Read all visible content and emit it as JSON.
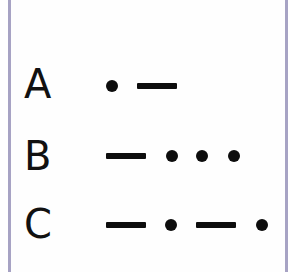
{
  "colors": {
    "border": "#a7a3c4",
    "ink": "#0d0d0d"
  },
  "rows": [
    {
      "letter": "A",
      "code": ".-",
      "symbols": [
        "dot",
        "dash"
      ]
    },
    {
      "letter": "B",
      "code": "-...",
      "symbols": [
        "dash",
        "dot",
        "dot",
        "dot"
      ]
    },
    {
      "letter": "C",
      "code": "-.-.",
      "symbols": [
        "dash",
        "dot",
        "dash",
        "dot"
      ]
    }
  ]
}
